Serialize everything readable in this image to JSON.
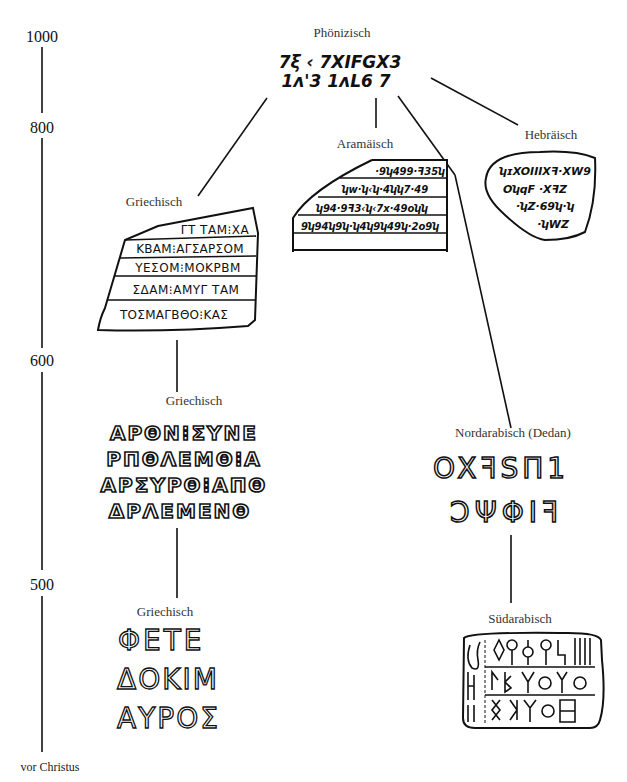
{
  "timeline": {
    "ticks": [
      {
        "value": 1000,
        "label": "1000"
      },
      {
        "value": 800,
        "label": "800"
      },
      {
        "value": 600,
        "label": "600"
      },
      {
        "value": 500,
        "label": "500"
      }
    ],
    "era_label": "vor Christus"
  },
  "nodes": {
    "phoenician": {
      "label": "Phönizisch",
      "line1": "7ξ ‹ 7XIFGX3",
      "line2": "1ʌ'3 1ʌL6 7"
    },
    "aramaic": {
      "label": "Aramäisch",
      "lines": [
        "·9ʮ499·ꟻ35ʮ",
        "ʮw·ʮ‹ʮ·4ʮʮ7·49",
        "ʮ94·9ꟻ3‹ʮ‹7x·49oʮʮ",
        "9ʮ94ʮ9ʮ·ʮ4ʮ9ʮ49ʮ·2o9ʮ"
      ]
    },
    "hebrew": {
      "label": "Hebräisch",
      "lines": [
        "ʮɪXOIIIXꟻ·XW9",
        "OʮqF ·XꟻZ",
        "·ʮZ·69ʮ·ʮ",
        "·ʮWZ"
      ]
    },
    "greek_early": {
      "label": "Griechisch",
      "lines": [
        "ΓΤ ΤΑΜ⁝ΧΑ",
        "ΚΒΑΜ⁝ΑΓΣΑΡΣΟΜ",
        "ΥΕΣΟΜ⁝ΜΟΚΡΒΜ",
        "ΣΔΑΜ⁝ΑΜΥΓ ΤΑΜ",
        "ΤΟΣΜΑΓΒΘΟ⁝ΚΑΣ"
      ]
    },
    "greek_middle": {
      "label": "Griechisch",
      "lines": [
        "ΑΡΘΝ⁝ΣΥΝΕ",
        "ΡΠΘΛΕΜΘ⁝Α",
        "ΑΡΣΥΡΘ⁝ΑΠΘ",
        "ΔΡΛΕΜΕΝΘ"
      ]
    },
    "greek_late": {
      "label": "Griechisch",
      "lines": [
        "ΦΕΤΕ",
        "ΔΟΚΙΜ",
        "ΑΥΡΟΣ"
      ]
    },
    "north_arabian": {
      "label": "Nordarabisch (Dedan)",
      "lines": [
        "OXꟻSΠ1",
        "ϽΨΦIꟻ"
      ]
    },
    "south_arabian": {
      "label": "Südarabisch"
    }
  }
}
